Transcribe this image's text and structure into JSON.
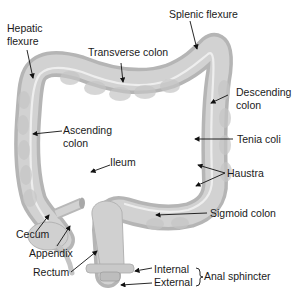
{
  "diagram": {
    "labels": {
      "hepatic_flexure_1": "Hepatic",
      "hepatic_flexure_2": "flexure",
      "splenic_flexure": "Splenic flexure",
      "transverse_colon": "Transverse colon",
      "descending_colon_1": "Descending",
      "descending_colon_2": "colon",
      "ascending_colon_1": "Ascending",
      "ascending_colon_2": "colon",
      "tenia_coli": "Tenia coli",
      "ileum": "Ileum",
      "haustra": "Haustra",
      "cecum": "Cecum",
      "sigmoid_colon": "Sigmoid colon",
      "appendix": "Appendix",
      "rectum": "Rectum",
      "internal": "Internal",
      "external": "External",
      "anal_sphincter": "Anal sphincter"
    },
    "colors": {
      "organ_fill": "#cfcfcf",
      "organ_shade": "#b3b3b3",
      "organ_highlight": "#e6e6e6",
      "tenia": "#efefef",
      "leader": "#111111",
      "text": "#1a1a1a"
    }
  }
}
